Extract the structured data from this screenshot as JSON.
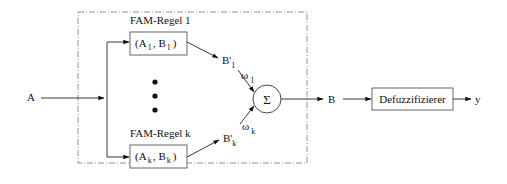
{
  "diagram": {
    "input_label": "A",
    "rules": [
      {
        "title": "FAM-Regel 1",
        "pair": {
          "a": "A",
          "a_sub": "1",
          "b": "B",
          "b_sub": "1"
        },
        "output": "B'",
        "output_sub": "1",
        "weight": "ω",
        "weight_sub": "1"
      },
      {
        "title": "FAM-Regel k",
        "pair": {
          "a": "A",
          "a_sub": "k",
          "b": "B",
          "b_sub": "k"
        },
        "output": "B'",
        "output_sub": "k",
        "weight": "ω",
        "weight_sub": "k"
      }
    ],
    "ellipsis": "•",
    "sum_symbol": "Σ",
    "sum_output_label": "B",
    "defuzzifier_label": "Defuzzifizierer",
    "final_output_label": "y",
    "separators": {
      "open": "(",
      "comma": ",",
      "close": ")"
    }
  }
}
